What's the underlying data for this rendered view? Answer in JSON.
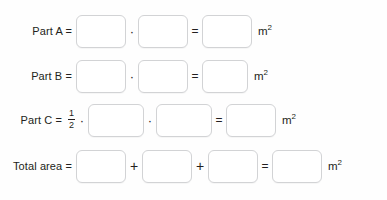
{
  "worksheet": {
    "unit_label": "m",
    "unit_exponent": "2",
    "operators": {
      "equals": "=",
      "multiply": "·",
      "plus": "+"
    },
    "fraction": {
      "numerator": "1",
      "denominator": "2"
    },
    "blank_placeholder": "",
    "rows": [
      {
        "id": "part-a",
        "label": "Part A =",
        "label_text": "Part A",
        "coefficient": null,
        "inputs": [
          {
            "name": "part-a-factor-1",
            "value": ""
          },
          {
            "name": "part-a-factor-2",
            "value": ""
          },
          {
            "name": "part-a-result",
            "value": ""
          }
        ],
        "operator_between_inputs": "·",
        "operator_before_result": "="
      },
      {
        "id": "part-b",
        "label": "Part B =",
        "label_text": "Part B",
        "coefficient": null,
        "inputs": [
          {
            "name": "part-b-factor-1",
            "value": ""
          },
          {
            "name": "part-b-factor-2",
            "value": ""
          },
          {
            "name": "part-b-result",
            "value": ""
          }
        ],
        "operator_between_inputs": "·",
        "operator_before_result": "="
      },
      {
        "id": "part-c",
        "label": "Part C =",
        "label_text": "Part C",
        "coefficient": "1/2",
        "inputs": [
          {
            "name": "part-c-factor-1",
            "value": ""
          },
          {
            "name": "part-c-factor-2",
            "value": ""
          },
          {
            "name": "part-c-result",
            "value": ""
          }
        ],
        "operator_between_inputs": "·",
        "operator_before_result": "="
      },
      {
        "id": "total-area",
        "label": "Total area =",
        "label_text": "Total area",
        "coefficient": null,
        "inputs": [
          {
            "name": "total-term-1",
            "value": ""
          },
          {
            "name": "total-term-2",
            "value": ""
          },
          {
            "name": "total-term-3",
            "value": ""
          },
          {
            "name": "total-result",
            "value": ""
          }
        ],
        "operator_between_inputs": "+",
        "operator_before_result": "="
      }
    ],
    "colors": {
      "text": "#231f20",
      "box_border": "#d2d3d5",
      "box_fill": "#ffffff",
      "background": "#ffffff"
    }
  }
}
